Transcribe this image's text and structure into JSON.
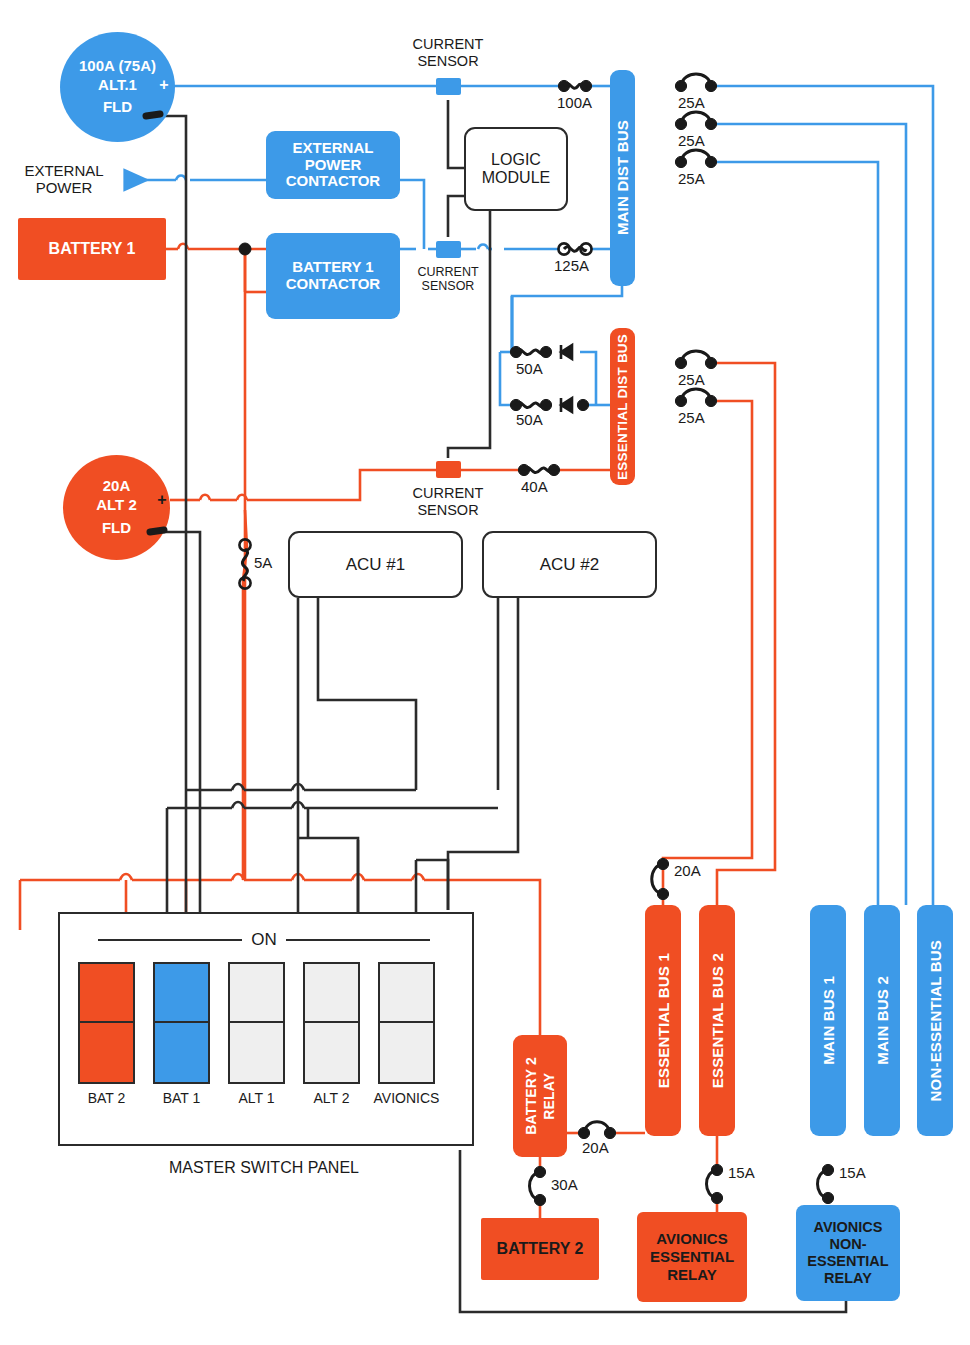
{
  "colors": {
    "orange": "#f04e23",
    "blue": "#3d9ae8",
    "wire_black": "#2b2b2b",
    "switch_off": "#efefef"
  },
  "sources": {
    "alt1": {
      "line1": "100A (75A)",
      "line2": "ALT.1",
      "line3": "FLD",
      "plus": "+"
    },
    "alt2": {
      "line1": "20A",
      "line2": "ALT 2",
      "line3": "FLD",
      "plus": "+"
    },
    "battery1": "BATTERY 1",
    "battery2": "BATTERY 2",
    "external_power": "EXTERNAL\nPOWER",
    "external_power_l1": "EXTERNAL",
    "external_power_l2": "POWER"
  },
  "contactors": {
    "external_power_contactor": "EXTERNAL\nPOWER\nCONTACTOR",
    "epc_l1": "EXTERNAL",
    "epc_l2": "POWER",
    "epc_l3": "CONTACTOR",
    "battery1_contactor": "BATTERY 1\nCONTACTOR",
    "b1c_l1": "BATTERY 1",
    "b1c_l2": "CONTACTOR"
  },
  "logic_module": {
    "l1": "LOGIC",
    "l2": "MODULE"
  },
  "current_sensors": [
    {
      "id": "cs-top",
      "l1": "CURRENT",
      "l2": "SENSOR"
    },
    {
      "id": "cs-battery",
      "l1": "CURRENT",
      "l2": "SENSOR"
    },
    {
      "id": "cs-alt2",
      "l1": "CURRENT",
      "l2": "SENSOR"
    }
  ],
  "buses": {
    "main_dist_bus": "MAIN DIST BUS",
    "essential_dist_bus": "ESSENTIAL DIST BUS",
    "essential_bus_1": "ESSENTIAL BUS 1",
    "essential_bus_2": "ESSENTIAL BUS 2",
    "main_bus_1": "MAIN BUS 1",
    "main_bus_2": "MAIN BUS 2",
    "non_essential_bus": "NON-ESSENTIAL BUS"
  },
  "acus": [
    {
      "label": "ACU #1"
    },
    {
      "label": "ACU #2"
    }
  ],
  "relays": {
    "battery2_relay": "BATTERY 2\nRELAY",
    "b2r_l1": "BATTERY 2",
    "b2r_l2": "RELAY",
    "avionics_essential_relay": "AVIONICS\nESSENTIAL\nRELAY",
    "aer_l1": "AVIONICS",
    "aer_l2": "ESSENTIAL",
    "aer_l3": "RELAY",
    "avionics_non_essential_relay": "AVIONICS\nNON-\nESSENTIAL\nRELAY",
    "aner_l1": "AVIONICS",
    "aner_l2": "NON-",
    "aner_l3": "ESSENTIAL",
    "aner_l4": "RELAY"
  },
  "fuses": [
    {
      "id": "f-100a",
      "label": "100A"
    },
    {
      "id": "f-125a",
      "label": "125A"
    },
    {
      "id": "f-25a-1",
      "label": "25A"
    },
    {
      "id": "f-25a-2",
      "label": "25A"
    },
    {
      "id": "f-25a-3",
      "label": "25A"
    },
    {
      "id": "f-50a-1",
      "label": "50A"
    },
    {
      "id": "f-50a-2",
      "label": "50A"
    },
    {
      "id": "f-40a",
      "label": "40A"
    },
    {
      "id": "f-25a-ess-1",
      "label": "25A"
    },
    {
      "id": "f-25a-ess-2",
      "label": "25A"
    },
    {
      "id": "f-5a",
      "label": "5A"
    },
    {
      "id": "f-20a-ess1",
      "label": "20A"
    },
    {
      "id": "f-20a-b2r",
      "label": "20A"
    },
    {
      "id": "f-30a",
      "label": "30A"
    },
    {
      "id": "f-15a-ess",
      "label": "15A"
    },
    {
      "id": "f-15a-noness",
      "label": "15A"
    }
  ],
  "master_switch_panel": {
    "title": "MASTER SWITCH PANEL",
    "on_label": "ON",
    "switches": [
      {
        "label": "BAT 2",
        "state": "on",
        "color": "#f04e23"
      },
      {
        "label": "BAT 1",
        "state": "on",
        "color": "#3d9ae8"
      },
      {
        "label": "ALT 1",
        "state": "off",
        "color": "#efefef"
      },
      {
        "label": "ALT 2",
        "state": "off",
        "color": "#efefef"
      },
      {
        "label": "AVIONICS",
        "state": "off",
        "color": "#efefef"
      }
    ]
  }
}
